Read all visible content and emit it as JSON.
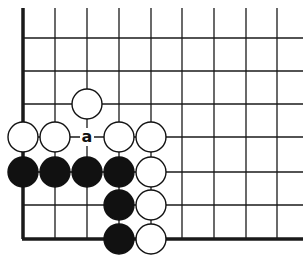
{
  "diagram": {
    "type": "go-board-corner",
    "grid": {
      "columns_x": [
        23,
        55,
        87,
        119,
        151,
        182,
        214,
        246,
        277
      ],
      "rows_y": [
        38,
        71,
        104,
        137,
        172,
        205,
        239
      ],
      "top_y": 8,
      "right_x": 303,
      "left_edge_x": 22,
      "bottom_edge_y": 239,
      "line_color": "#1a1a1a"
    },
    "stone_radius": 15,
    "stones": [
      {
        "color": "white",
        "col": 2,
        "row": 2
      },
      {
        "color": "white",
        "col": 0,
        "row": 3
      },
      {
        "color": "white",
        "col": 1,
        "row": 3
      },
      {
        "color": "white",
        "col": 3,
        "row": 3
      },
      {
        "color": "white",
        "col": 4,
        "row": 3
      },
      {
        "color": "black",
        "col": 0,
        "row": 4
      },
      {
        "color": "black",
        "col": 1,
        "row": 4
      },
      {
        "color": "black",
        "col": 2,
        "row": 4
      },
      {
        "color": "black",
        "col": 3,
        "row": 4
      },
      {
        "color": "white",
        "col": 4,
        "row": 4
      },
      {
        "color": "black",
        "col": 3,
        "row": 5
      },
      {
        "color": "white",
        "col": 4,
        "row": 5
      },
      {
        "color": "black",
        "col": 3,
        "row": 6
      },
      {
        "color": "white",
        "col": 4,
        "row": 6
      }
    ],
    "labels": [
      {
        "text": "a",
        "col": 2,
        "row": 3
      }
    ]
  }
}
